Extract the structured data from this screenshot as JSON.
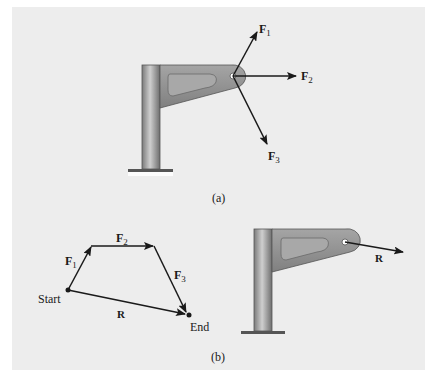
{
  "figure": {
    "part_a": {
      "caption": "(a)",
      "forces": [
        {
          "symbol": "F",
          "subscript": "1"
        },
        {
          "symbol": "F",
          "subscript": "2"
        },
        {
          "symbol": "F",
          "subscript": "3"
        }
      ]
    },
    "part_b": {
      "caption": "(b)",
      "polygon": {
        "start_label": "Start",
        "end_label": "End",
        "forces": [
          {
            "symbol": "F",
            "subscript": "1"
          },
          {
            "symbol": "F",
            "subscript": "2"
          },
          {
            "symbol": "F",
            "subscript": "3"
          }
        ],
        "resultant_label": "R"
      },
      "bracket_resultant_label": "R"
    }
  },
  "colors": {
    "panel_bg": "#ededed",
    "arrow": "#1a1a1a",
    "bracket_fill": "#8f8f8f",
    "post_fill": "#9a9a9a"
  }
}
